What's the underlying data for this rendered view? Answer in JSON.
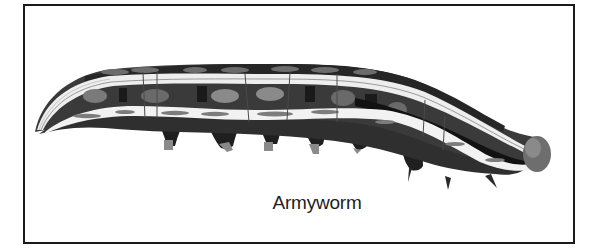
{
  "figure": {
    "caption": "Armyworm",
    "style": "grayscale-illustration",
    "colors": {
      "border": "#1a1a1a",
      "background": "#ffffff",
      "body_dark": "#2e2e2e",
      "body_mid": "#555555",
      "stripe_light": "#f2f2f2",
      "spot_gray": "#8a8a8a",
      "head": "#6e6e6e"
    }
  }
}
